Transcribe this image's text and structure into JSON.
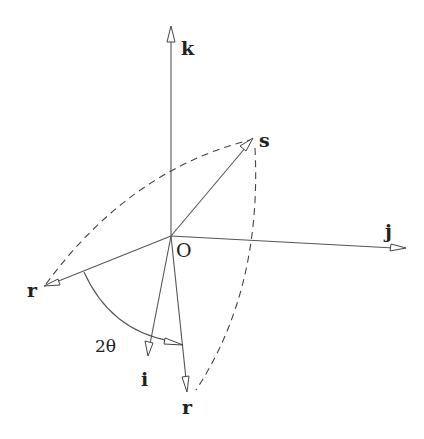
{
  "figure": {
    "type": "vector-rotation-diagram",
    "labels": {
      "k": "k",
      "s": "s",
      "j": "j",
      "origin": "O",
      "r_start": "r",
      "i": "i",
      "r_end": "r",
      "angle": "2θ"
    },
    "points": {
      "O": [
        171,
        236
      ],
      "k": [
        171,
        26
      ],
      "s": [
        253,
        138
      ],
      "j": [
        406,
        248
      ],
      "r_start": [
        44,
        286
      ],
      "i": [
        148,
        356
      ],
      "r_end": [
        187,
        392
      ]
    },
    "colors": {
      "line": "#555555",
      "text": "#222222",
      "background": "#ffffff"
    }
  }
}
